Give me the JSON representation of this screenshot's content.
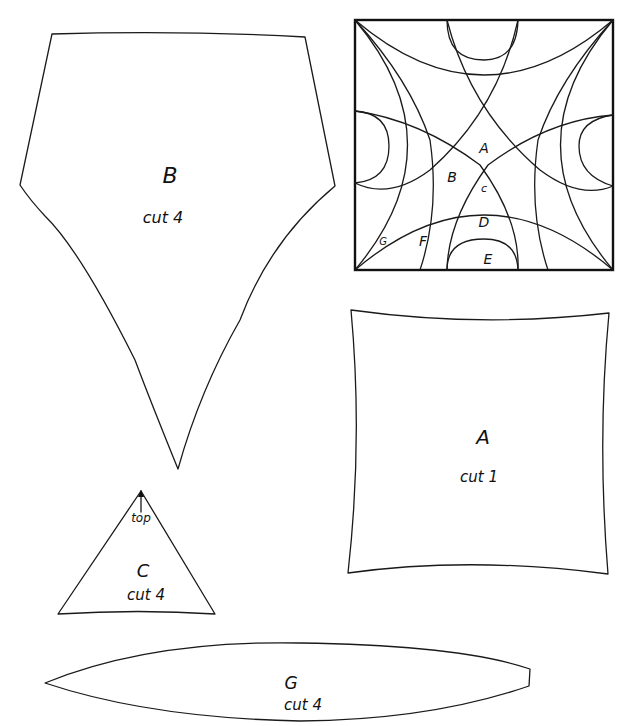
{
  "pieces": {
    "B": {
      "letter": "B",
      "cut": "cut 4"
    },
    "A": {
      "letter": "A",
      "cut": "cut 1"
    },
    "C": {
      "letter": "C",
      "cut": "cut 4",
      "note": "top"
    },
    "G": {
      "letter": "G",
      "cut": "cut 4"
    }
  },
  "block_diagram": {
    "labels": {
      "A": "A",
      "B": "B",
      "C": "c",
      "D": "D",
      "E": "E",
      "F": "F",
      "G": "G"
    }
  },
  "colors": {
    "ink": "#1a1a1a",
    "paper": "#ffffff"
  }
}
